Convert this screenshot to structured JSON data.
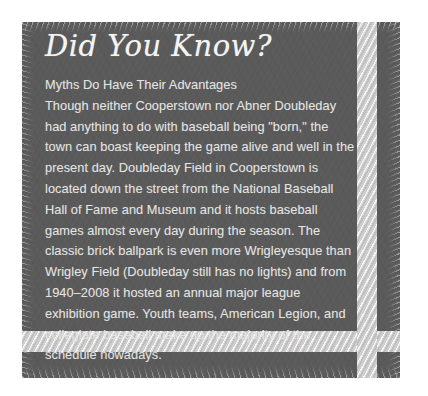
{
  "card": {
    "title": "Did You Know?",
    "subheading": "Myths Do Have Their Advantages",
    "paragraph": "Though neither Cooperstown nor Abner Doubleday had anything to do with baseball being \"born,\" the town can boast keeping the game alive and well in the present day. Doubleday Field in Cooperstown is located down the street from the National Baseball Hall of Fame and Museum and it hosts baseball games almost every day during the season. The classic brick ballpark is even more Wrigleyesque than Wrigley Field (Doubleday still has no lights) and from 1940–2008 it hosted an annual major league exhibition game. Youth teams, American Legion, and collegiate baseball make up the majority of the schedule nowadays."
  },
  "colors": {
    "page_background": "#ffffff",
    "card_background": "#5a5a5a",
    "title_text": "#f4f4f2",
    "body_text": "#e4e4e2",
    "stripe": "#cfcfcf"
  }
}
